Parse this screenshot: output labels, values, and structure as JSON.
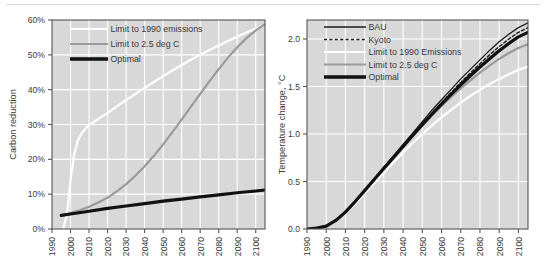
{
  "figure": {
    "background_color": "#ffffff",
    "plot_background_color": "#d8d8d8",
    "gridline_color": "#ffffff",
    "axis_color": "#555555",
    "text_color": "#3a3a3a"
  },
  "chart_data": [
    {
      "id": "carbon-reduction",
      "type": "line",
      "title": "",
      "xlabel": "",
      "ylabel": "Carbon reduction",
      "xlim": [
        1990,
        2105
      ],
      "ylim": [
        0,
        60
      ],
      "xticks": [
        1990,
        2000,
        2010,
        2020,
        2030,
        2040,
        2050,
        2060,
        2070,
        2080,
        2090,
        2100
      ],
      "xticklabels": [
        "1990",
        "2000",
        "2010",
        "2020",
        "2030",
        "2040",
        "2050",
        "2060",
        "2070",
        "2080",
        "2090",
        "2100"
      ],
      "yticks": [
        0,
        10,
        20,
        30,
        40,
        50,
        60
      ],
      "yticklabels": [
        "0%",
        "10%",
        "20%",
        "30%",
        "40%",
        "50%",
        "60%"
      ],
      "grid": true,
      "legend_position": "upper-left",
      "series": [
        {
          "name": "Limit to 1990 emissions",
          "color": "#ffffff",
          "width": 2.2,
          "dash": "none",
          "x": [
            1996,
            1998,
            2000,
            2002,
            2004,
            2006,
            2008,
            2010,
            2015,
            2020,
            2025,
            2030,
            2035,
            2040,
            2045,
            2050,
            2055,
            2060,
            2065,
            2070,
            2075,
            2080,
            2085,
            2090,
            2095,
            2100,
            2105
          ],
          "y": [
            0.0,
            4.0,
            14.0,
            21.5,
            25.5,
            27.5,
            28.8,
            29.8,
            31.6,
            33.3,
            35.2,
            37.0,
            38.8,
            40.5,
            42.2,
            43.9,
            45.5,
            47.1,
            48.6,
            50.0,
            51.4,
            52.7,
            54.0,
            55.2,
            56.4,
            57.5,
            58.6
          ]
        },
        {
          "name": "Limit to 2.5 deg C",
          "color": "#9a9a9a",
          "width": 2.2,
          "dash": "none",
          "x": [
            1995,
            2000,
            2005,
            2010,
            2015,
            2020,
            2025,
            2030,
            2035,
            2040,
            2045,
            2050,
            2055,
            2060,
            2065,
            2070,
            2075,
            2080,
            2085,
            2090,
            2095,
            2100,
            2105
          ],
          "y": [
            3.9,
            4.6,
            5.4,
            6.4,
            7.6,
            9.0,
            10.8,
            12.9,
            15.3,
            18.0,
            21.0,
            24.3,
            27.8,
            31.4,
            35.1,
            38.8,
            42.4,
            45.9,
            49.2,
            52.2,
            54.8,
            57.0,
            58.8
          ]
        },
        {
          "name": "Optimal",
          "color": "#111111",
          "width": 3.2,
          "dash": "none",
          "x": [
            1995,
            2000,
            2010,
            2020,
            2030,
            2040,
            2050,
            2060,
            2070,
            2080,
            2090,
            2100,
            2105
          ],
          "y": [
            3.9,
            4.3,
            5.1,
            5.9,
            6.6,
            7.3,
            8.0,
            8.6,
            9.2,
            9.8,
            10.4,
            10.9,
            11.2
          ]
        }
      ],
      "legend": [
        {
          "label": "Limit to 1990 emissions",
          "color": "#ffffff",
          "width": 2.2,
          "dash": "none"
        },
        {
          "label": "Limit to 2.5 deg C",
          "color": "#9a9a9a",
          "width": 2.2,
          "dash": "none"
        },
        {
          "label": "Optimal",
          "color": "#111111",
          "width": 3.4,
          "dash": "none"
        }
      ]
    },
    {
      "id": "temperature-change",
      "type": "line",
      "title": "",
      "xlabel": "",
      "ylabel": "Temperature change, °C",
      "xlim": [
        1990,
        2105
      ],
      "ylim": [
        0.0,
        2.2
      ],
      "xticks": [
        1990,
        2000,
        2010,
        2020,
        2030,
        2040,
        2050,
        2060,
        2070,
        2080,
        2090,
        2100
      ],
      "xticklabels": [
        "1990",
        "2000",
        "2010",
        "2020",
        "2030",
        "2040",
        "2050",
        "2060",
        "2070",
        "2080",
        "2090",
        "2100"
      ],
      "yticks": [
        0.0,
        0.5,
        1.0,
        1.5,
        2.0
      ],
      "yticklabels": [
        "0.0",
        "0.5",
        "1.0",
        "1.5",
        "2.0"
      ],
      "grid": true,
      "legend_position": "upper-left",
      "series": [
        {
          "name": "BAU",
          "color": "#1c1c1c",
          "width": 1.3,
          "dash": "none",
          "x": [
            1990,
            1995,
            2000,
            2005,
            2010,
            2015,
            2020,
            2025,
            2030,
            2035,
            2040,
            2045,
            2050,
            2055,
            2060,
            2065,
            2070,
            2075,
            2080,
            2085,
            2090,
            2095,
            2100,
            2105
          ],
          "y": [
            0.0,
            0.01,
            0.03,
            0.09,
            0.18,
            0.29,
            0.41,
            0.53,
            0.65,
            0.77,
            0.89,
            1.01,
            1.13,
            1.25,
            1.36,
            1.47,
            1.58,
            1.68,
            1.78,
            1.88,
            1.97,
            2.05,
            2.12,
            2.17
          ]
        },
        {
          "name": "Kyoto",
          "color": "#1c1c1c",
          "width": 1.4,
          "dash": "3,2.4",
          "x": [
            1990,
            1995,
            2000,
            2005,
            2010,
            2015,
            2020,
            2025,
            2030,
            2035,
            2040,
            2045,
            2050,
            2055,
            2060,
            2065,
            2070,
            2075,
            2080,
            2085,
            2090,
            2095,
            2100,
            2105
          ],
          "y": [
            0.0,
            0.01,
            0.03,
            0.09,
            0.175,
            0.283,
            0.4,
            0.518,
            0.636,
            0.754,
            0.872,
            0.99,
            1.105,
            1.22,
            1.33,
            1.437,
            1.543,
            1.643,
            1.74,
            1.833,
            1.92,
            2.0,
            2.07,
            2.12
          ]
        },
        {
          "name": "Limit to 1990 Emissions",
          "color": "#ffffff",
          "width": 2.2,
          "dash": "none",
          "x": [
            1990,
            1995,
            2000,
            2005,
            2010,
            2015,
            2020,
            2025,
            2030,
            2035,
            2040,
            2045,
            2050,
            2055,
            2060,
            2065,
            2070,
            2075,
            2080,
            2085,
            2090,
            2095,
            2100,
            2105
          ],
          "y": [
            0.0,
            0.01,
            0.03,
            0.085,
            0.165,
            0.265,
            0.375,
            0.485,
            0.595,
            0.7,
            0.805,
            0.905,
            1.0,
            1.09,
            1.175,
            1.255,
            1.33,
            1.4,
            1.465,
            1.525,
            1.58,
            1.63,
            1.675,
            1.71
          ]
        },
        {
          "name": "Limit to 2.5 deg C",
          "color": "#9a9a9a",
          "width": 2.2,
          "dash": "none",
          "x": [
            1990,
            1995,
            2000,
            2005,
            2010,
            2015,
            2020,
            2025,
            2030,
            2035,
            2040,
            2045,
            2050,
            2055,
            2060,
            2065,
            2070,
            2075,
            2080,
            2085,
            2090,
            2095,
            2100,
            2105
          ],
          "y": [
            0.0,
            0.01,
            0.03,
            0.09,
            0.178,
            0.288,
            0.405,
            0.523,
            0.64,
            0.756,
            0.87,
            0.982,
            1.09,
            1.195,
            1.295,
            1.39,
            1.48,
            1.565,
            1.645,
            1.72,
            1.79,
            1.852,
            1.905,
            1.945
          ]
        },
        {
          "name": "Optimal",
          "color": "#111111",
          "width": 3.2,
          "dash": "none",
          "x": [
            1990,
            1995,
            2000,
            2005,
            2010,
            2015,
            2020,
            2025,
            2030,
            2035,
            2040,
            2045,
            2050,
            2055,
            2060,
            2065,
            2070,
            2075,
            2080,
            2085,
            2090,
            2095,
            2100,
            2105
          ],
          "y": [
            0.0,
            0.01,
            0.03,
            0.09,
            0.178,
            0.287,
            0.404,
            0.521,
            0.638,
            0.754,
            0.87,
            0.985,
            1.098,
            1.208,
            1.315,
            1.418,
            1.518,
            1.613,
            1.705,
            1.793,
            1.877,
            1.953,
            2.022,
            2.07
          ]
        }
      ],
      "legend": [
        {
          "label": "BAU",
          "color": "#1c1c1c",
          "width": 1.4,
          "dash": "none"
        },
        {
          "label": "Kyoto",
          "color": "#1c1c1c",
          "width": 1.6,
          "dash": "3,2.4"
        },
        {
          "label": "Limit to 1990 Emissions",
          "color": "#ffffff",
          "width": 2.2,
          "dash": "none"
        },
        {
          "label": "Limit to 2.5 deg C",
          "color": "#9a9a9a",
          "width": 2.2,
          "dash": "none"
        },
        {
          "label": "Optimal",
          "color": "#111111",
          "width": 3.4,
          "dash": "none"
        }
      ]
    }
  ]
}
